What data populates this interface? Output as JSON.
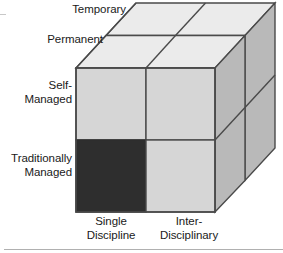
{
  "diagram": {
    "type": "3d-cube-matrix",
    "colors": {
      "face_front_light": "#d6d6d6",
      "face_front_dark": "#2e2e2e",
      "face_top": "#ebebeb",
      "face_side": "#b9b9b9",
      "outline": "#4a4a4a",
      "text": "#1a1a1a",
      "rule": "#b0b0b0",
      "background": "#ffffff"
    },
    "axes": {
      "vertical": {
        "name": "Management style",
        "labels": [
          "Self-\nManaged",
          "Traditionally\nManaged"
        ]
      },
      "horizontal": {
        "name": "Discipline scope",
        "labels": [
          "Single\nDiscipline",
          "Inter-\nDisciplinary"
        ]
      },
      "depth": {
        "name": "Duration",
        "labels": [
          "Temporary",
          "Permanent"
        ]
      }
    },
    "labels": {
      "temporary": "Temporary",
      "permanent": "Permanent",
      "self_managed": "Self-\nManaged",
      "traditionally_managed": "Traditionally\nManaged",
      "single_discipline": "Single\nDiscipline",
      "inter_disciplinary": "Inter-\nDisciplinary"
    },
    "cells": [
      {
        "id": "front-top-left",
        "row": "Self-Managed",
        "column": "Single Discipline",
        "depth": "Permanent",
        "shade": "light",
        "highlighted": false
      },
      {
        "id": "front-top-right",
        "row": "Self-Managed",
        "column": "Inter-Disciplinary",
        "depth": "Permanent",
        "shade": "light",
        "highlighted": false
      },
      {
        "id": "front-bottom-left",
        "row": "Traditionally Managed",
        "column": "Single Discipline",
        "depth": "Permanent",
        "shade": "dark",
        "highlighted": true
      },
      {
        "id": "front-bottom-right",
        "row": "Traditionally Managed",
        "column": "Inter-Disciplinary",
        "depth": "Permanent",
        "shade": "light",
        "highlighted": false
      }
    ]
  },
  "geometry": {
    "front": {
      "x0": 76,
      "y0": 68,
      "x1": 215,
      "y1": 212,
      "split_x": 146,
      "split_y": 140
    },
    "depth": {
      "dx": 60,
      "dy": -65
    },
    "side_split_y": 148
  }
}
